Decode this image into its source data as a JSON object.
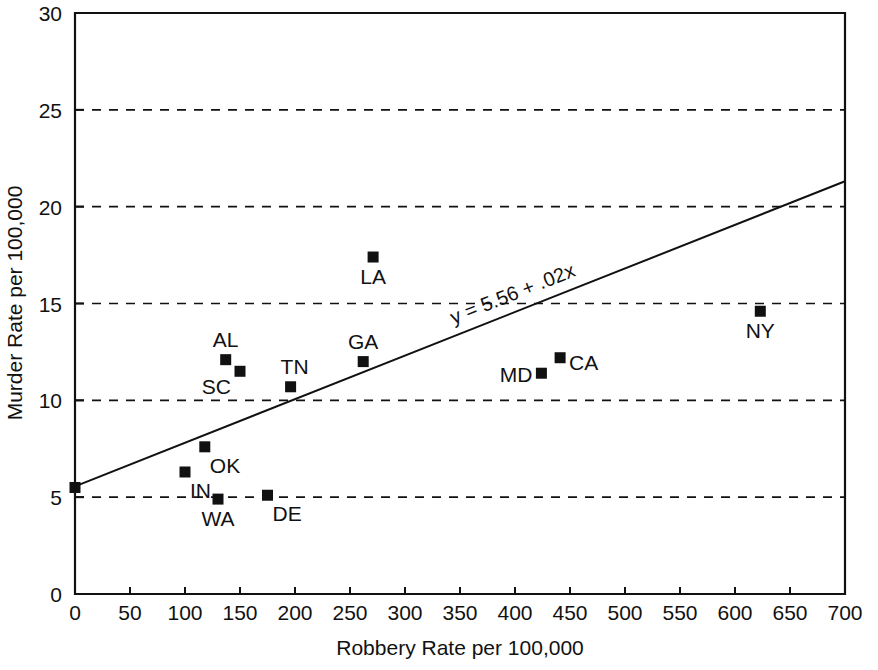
{
  "chart_data": {
    "type": "scatter",
    "title": "",
    "subtitle": "",
    "xlabel": "Robbery Rate per 100,000",
    "ylabel": "Murder Rate per 100,000",
    "xlim": [
      0,
      700
    ],
    "ylim": [
      0,
      30
    ],
    "xticks": [
      0,
      50,
      100,
      150,
      200,
      250,
      300,
      350,
      400,
      450,
      500,
      550,
      600,
      650,
      700
    ],
    "xtick_labels": [
      "0",
      "50",
      "100",
      "150",
      "200",
      "250",
      "300",
      "350",
      "400",
      "450",
      "500",
      "550",
      "600",
      "650",
      "700"
    ],
    "yticks": [
      0,
      5,
      10,
      15,
      20,
      25,
      30
    ],
    "ytick_labels": [
      "0",
      "5",
      "10",
      "15",
      "20",
      "25",
      "30"
    ],
    "grid": "horizontal-dashed",
    "gridlines_y": [
      5,
      10,
      15,
      20,
      25
    ],
    "legend": "none",
    "marker_style": "filled-square",
    "marker_color": "#111111",
    "points": [
      {
        "label": "",
        "x": 0,
        "y": 5.5,
        "label_pos": "none"
      },
      {
        "label": "IN",
        "x": 100,
        "y": 6.3,
        "label_pos": "below-right"
      },
      {
        "label": "OK",
        "x": 118,
        "y": 7.6,
        "label_pos": "below-right"
      },
      {
        "label": "WA",
        "x": 130,
        "y": 4.9,
        "label_pos": "below"
      },
      {
        "label": "AL",
        "x": 137,
        "y": 12.1,
        "label_pos": "above"
      },
      {
        "label": "SC",
        "x": 150,
        "y": 11.5,
        "label_pos": "below-left"
      },
      {
        "label": "DE",
        "x": 175,
        "y": 5.1,
        "label_pos": "below-right"
      },
      {
        "label": "TN",
        "x": 196,
        "y": 10.7,
        "label_pos": "above-right"
      },
      {
        "label": "GA",
        "x": 262,
        "y": 12.0,
        "label_pos": "above"
      },
      {
        "label": "LA",
        "x": 271,
        "y": 17.4,
        "label_pos": "below"
      },
      {
        "label": "MD",
        "x": 424,
        "y": 11.4,
        "label_pos": "left"
      },
      {
        "label": "CA",
        "x": 441,
        "y": 12.2,
        "label_pos": "right"
      },
      {
        "label": "NY",
        "x": 623,
        "y": 14.6,
        "label_pos": "below"
      }
    ],
    "fit_line": {
      "equation_label": "y = 5.56 + .02x",
      "intercept": 5.56,
      "slope": 0.0225,
      "x_start": 0,
      "x_end": 700
    }
  }
}
